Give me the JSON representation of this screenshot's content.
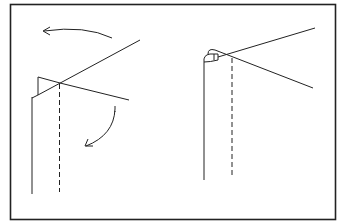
{
  "diagram": {
    "stroke_color": "#222222",
    "background": "#ffffff",
    "panels": [
      {
        "id": "step-1",
        "elements": [
          "fold-back-arrow",
          "fold-down-arrow",
          "diagonal-fold-line",
          "flap-outline",
          "solid-edge",
          "dashed-crease"
        ]
      },
      {
        "id": "step-2",
        "elements": [
          "curl-loop",
          "crossing-lines",
          "solid-edge",
          "dashed-crease"
        ]
      }
    ]
  }
}
